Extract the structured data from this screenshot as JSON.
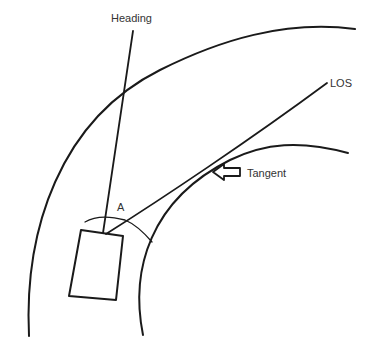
{
  "diagram": {
    "labels": {
      "heading": "Heading",
      "los": "LOS",
      "tangent": "Tangent",
      "angle": "A"
    },
    "colors": {
      "ink": "#1a1a1a",
      "text": "#333333",
      "background": "#ffffff"
    }
  }
}
